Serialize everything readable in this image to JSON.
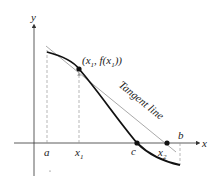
{
  "diagram": {
    "axes": {
      "x_label": "x",
      "y_label": "y"
    },
    "labels": {
      "point": "(x",
      "point_sub": "1",
      "point_rest": ", f(x",
      "point_sub2": "1",
      "point_close": "))",
      "tangent": "Tangent line",
      "a": "a",
      "x1": "x",
      "x1_sub": "1",
      "c": "c",
      "x2": "x",
      "x2_sub": "2",
      "b": "b"
    },
    "colors": {
      "curve": "#111111",
      "tangent": "#aaaaaa",
      "axis": "#333333",
      "dashed": "#999999"
    }
  }
}
